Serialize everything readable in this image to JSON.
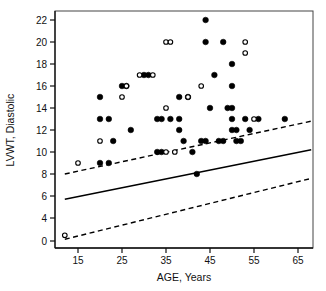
{
  "chart_data": {
    "type": "scatter",
    "title": "",
    "xlabel": "AGE, Years",
    "ylabel": "LVWT, Diastolic",
    "xlim": [
      11,
      70
    ],
    "ylim": [
      0,
      23
    ],
    "xticks": [
      15,
      25,
      35,
      45,
      55,
      65
    ],
    "yticks": [
      0,
      4,
      6,
      8,
      10,
      12,
      14,
      16,
      18,
      20,
      22
    ],
    "grid": false,
    "legend": "none",
    "y_axis_break": true,
    "y_axis_break_note": "y axis is broken between 0 and 4",
    "series": [
      {
        "name": "filled-circles",
        "marker": "filled-circle",
        "points": [
          [
            20,
            15
          ],
          [
            20,
            13
          ],
          [
            22,
            13
          ],
          [
            20,
            9
          ],
          [
            22,
            9
          ],
          [
            23,
            11
          ],
          [
            25,
            16
          ],
          [
            26,
            16
          ],
          [
            27,
            12
          ],
          [
            30,
            17
          ],
          [
            31,
            17
          ],
          [
            33,
            13
          ],
          [
            34,
            13
          ],
          [
            33,
            10
          ],
          [
            34,
            10
          ],
          [
            36,
            13
          ],
          [
            38,
            13
          ],
          [
            38,
            15
          ],
          [
            40,
            15
          ],
          [
            38,
            12
          ],
          [
            39,
            11
          ],
          [
            41,
            10
          ],
          [
            42,
            8
          ],
          [
            43,
            11
          ],
          [
            44,
            11
          ],
          [
            44,
            22
          ],
          [
            44,
            20
          ],
          [
            45,
            14
          ],
          [
            46,
            17
          ],
          [
            47,
            11
          ],
          [
            48,
            11
          ],
          [
            48,
            20
          ],
          [
            49,
            14
          ],
          [
            50,
            14
          ],
          [
            50,
            16
          ],
          [
            50,
            18
          ],
          [
            50,
            13
          ],
          [
            50,
            12
          ],
          [
            51,
            12
          ],
          [
            51,
            11
          ],
          [
            52,
            11
          ],
          [
            53,
            13
          ],
          [
            54,
            12
          ],
          [
            56,
            13
          ],
          [
            62,
            13
          ]
        ]
      },
      {
        "name": "open-circles",
        "marker": "open-circle",
        "points": [
          [
            12,
            1
          ],
          [
            15,
            9
          ],
          [
            20,
            11
          ],
          [
            25,
            15
          ],
          [
            26,
            16
          ],
          [
            29,
            17
          ],
          [
            32,
            17
          ],
          [
            35,
            14
          ],
          [
            35,
            20
          ],
          [
            36,
            20
          ],
          [
            35,
            10
          ],
          [
            37,
            10
          ],
          [
            40,
            15
          ],
          [
            43,
            16
          ],
          [
            53,
            20
          ],
          [
            53,
            19
          ],
          [
            55,
            13
          ]
        ]
      }
    ],
    "lines": [
      {
        "name": "regression-line",
        "style": "solid",
        "x1": 12,
        "y1": 5.7,
        "x2": 68,
        "y2": 10.2
      },
      {
        "name": "upper-confidence-band",
        "style": "dashed",
        "x1": 12,
        "y1": 8.0,
        "x2": 68,
        "y2": 12.8
      },
      {
        "name": "lower-confidence-band",
        "style": "dashed",
        "x1": 12,
        "y1": 0.3,
        "x2": 68,
        "y2": 7.6
      }
    ]
  }
}
